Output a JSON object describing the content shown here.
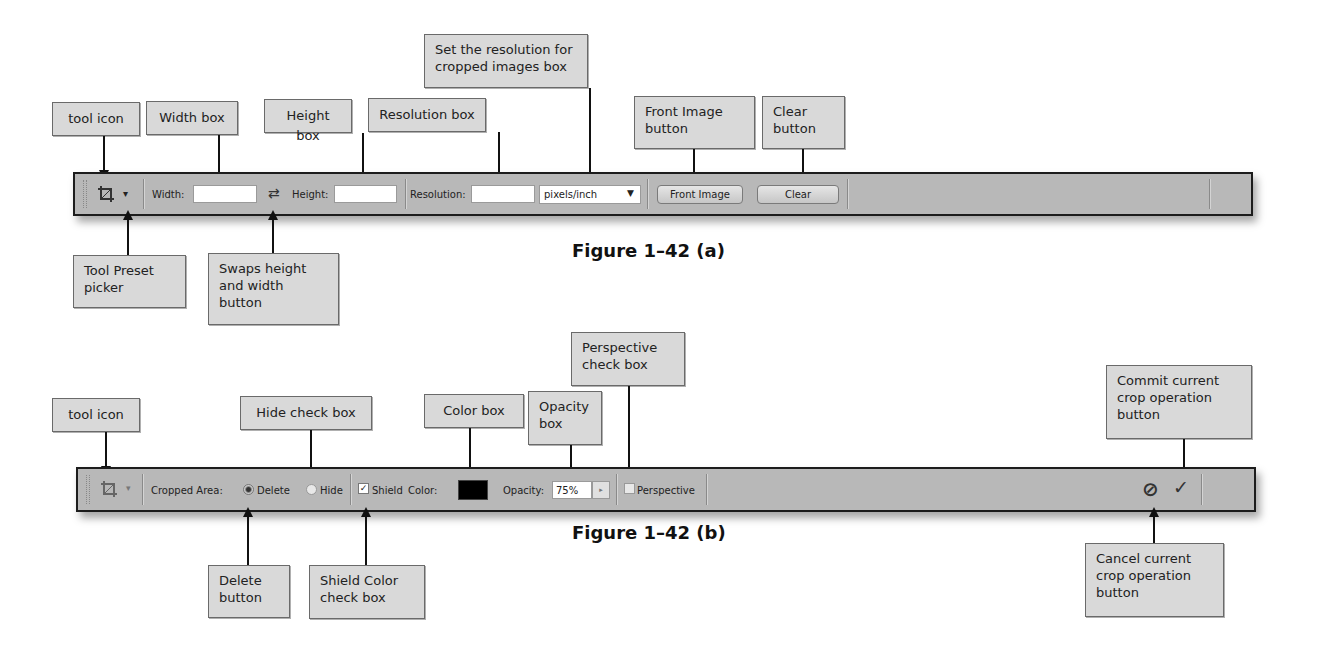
{
  "figure_a": {
    "caption": "Figure 1–42 (a)",
    "toolbar": {
      "tool_icon": "crop-icon",
      "tool_preset_picker": "▾",
      "width_label": "Width:",
      "width_value": "",
      "swap_icon": "⇄",
      "height_label": "Height:",
      "height_value": "",
      "resolution_label": "Resolution:",
      "resolution_value": "",
      "resolution_unit": "pixels/inch",
      "front_image_button": "Front Image",
      "clear_button": "Clear"
    },
    "callouts": {
      "tool_icon": "tool icon",
      "width_box": "Width box",
      "height_box": "Height box",
      "resolution_box": "Resolution box",
      "resolution_unit_line1": "Set the resolution for",
      "resolution_unit_line2": "cropped images box",
      "front_image_line1": "Front Image",
      "front_image_line2": "button",
      "clear_line1": "Clear",
      "clear_line2": "button",
      "tool_preset_line1": "Tool Preset",
      "tool_preset_line2": "picker",
      "swap_line1": "Swaps height",
      "swap_line2": "and width",
      "swap_line3": "button"
    }
  },
  "figure_b": {
    "caption": "Figure 1–42 (b)",
    "toolbar": {
      "tool_icon": "crop-icon",
      "tool_preset_picker": "▾",
      "cropped_area_label": "Cropped Area:",
      "delete_label": "Delete",
      "delete_selected": true,
      "hide_label": "Hide",
      "hide_selected": false,
      "shield_label": "Shield",
      "shield_checked": true,
      "color_label": "Color:",
      "color_value": "#000000",
      "opacity_label": "Opacity:",
      "opacity_value": "75%",
      "perspective_label": "Perspective",
      "perspective_checked": false,
      "cancel_icon": "⊘",
      "commit_icon": "✓"
    },
    "callouts": {
      "tool_icon": "tool icon",
      "hide_check_box": "Hide check box",
      "color_box": "Color box",
      "opacity_line1": "Opacity",
      "opacity_line2": "box",
      "perspective_line1": "Perspective",
      "perspective_line2": "check box",
      "commit_line1": "Commit current",
      "commit_line2": "crop operation",
      "commit_line3": "button",
      "delete_line1": "Delete",
      "delete_line2": "button",
      "shield_line1": "Shield Color",
      "shield_line2": "check box",
      "cancel_line1": "Cancel current",
      "cancel_line2": "crop operation",
      "cancel_line3": "button"
    }
  }
}
